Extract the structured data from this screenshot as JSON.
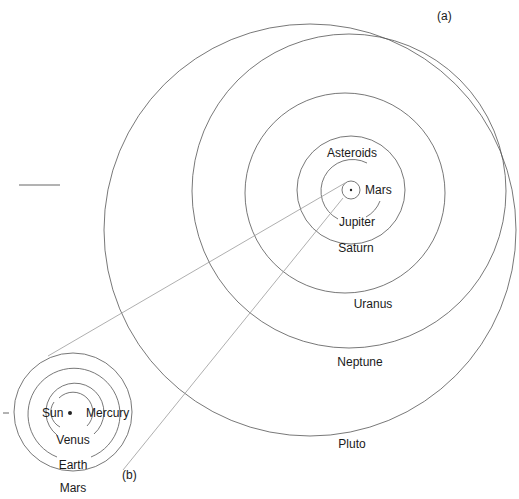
{
  "figure": {
    "panel_a_label": "(a)",
    "panel_b_label": "(b)",
    "colors": {
      "orbit": "#555555",
      "guide": "#9a9a9a",
      "text": "#1a1a1a",
      "background": "#ffffff"
    }
  },
  "outer_system": {
    "labels": {
      "asteroids": "Asteroids",
      "mars": "Mars",
      "jupiter": "Jupiter",
      "saturn": "Saturn",
      "uranus": "Uranus",
      "neptune": "Neptune",
      "pluto": "Pluto"
    }
  },
  "inner_system": {
    "labels": {
      "sun": "Sun",
      "mercury": "Mercury",
      "venus": "Venus",
      "earth": "Earth",
      "mars": "Mars"
    }
  }
}
